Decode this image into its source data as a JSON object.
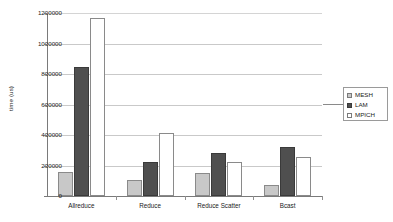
{
  "chart_data": {
    "type": "bar",
    "title": "",
    "xlabel": "",
    "ylabel": "time (us)",
    "categories": [
      "Allreduce",
      "Reduce",
      "Reduce Scatter",
      "Bcast"
    ],
    "series": [
      {
        "name": "MESH",
        "color": "#c8c8c8",
        "values": [
          160000,
          103000,
          148000,
          70000
        ]
      },
      {
        "name": "LAM",
        "color": "#4f4f4f",
        "values": [
          845000,
          222000,
          285000,
          322000
        ]
      },
      {
        "name": "MPICH",
        "color": "#ffffff",
        "values": [
          1170000,
          413000,
          225000,
          258000
        ]
      }
    ],
    "ylim": [
      0,
      1200000
    ],
    "ytick_labels": [
      "1200000",
      "1000000",
      "800000",
      "600000",
      "400000",
      "200000",
      "0"
    ],
    "ytick_values": [
      1200000,
      1000000,
      800000,
      600000,
      400000,
      200000,
      0
    ],
    "grid": true,
    "legend_position": "right"
  },
  "legend": {
    "entries": [
      {
        "label": "MESH"
      },
      {
        "label": "LAM"
      },
      {
        "label": "MPICH"
      }
    ]
  }
}
